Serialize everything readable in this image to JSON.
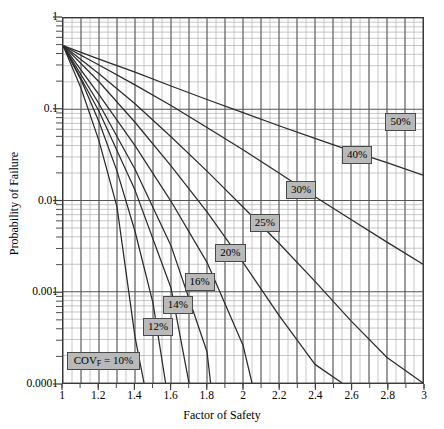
{
  "chart_data": {
    "type": "line",
    "title": "",
    "xlabel": "Factor of Safety",
    "ylabel": "Probability of Failure",
    "xscale": "linear",
    "yscale": "log",
    "xlim": [
      1,
      3
    ],
    "ylim": [
      0.0001,
      1
    ],
    "grid": true,
    "grid_style": "log-minor y, 0.05 minor x",
    "legend": "inline boxed labels on each curve",
    "xticks": [
      "1",
      "1.2",
      "1.4",
      "1.6",
      "1.8",
      "2",
      "2.2",
      "2.4",
      "2.6",
      "2.8",
      "3"
    ],
    "xtick_values": [
      1,
      1.2,
      1.4,
      1.6,
      1.8,
      2,
      2.2,
      2.4,
      2.6,
      2.8,
      3
    ],
    "yticks": [
      "1",
      "0.1",
      "0.01",
      "0.001",
      "0.0001"
    ],
    "ytick_values": [
      1,
      0.1,
      0.01,
      0.001,
      0.0001
    ],
    "series": [
      {
        "name": "COV_F = 10%",
        "label": "COV<sub>F</sub> = 10%",
        "label_text": "COVF = 10%",
        "cov_percent": 10,
        "x": [
          1.0,
          1.1,
          1.2,
          1.3,
          1.4,
          1.45
        ],
        "y": [
          0.5,
          0.17,
          0.045,
          0.0085,
          0.00032,
          0.0001
        ]
      },
      {
        "name": "12%",
        "label": "12%",
        "cov_percent": 12,
        "x": [
          1.0,
          1.1,
          1.2,
          1.3,
          1.4,
          1.5,
          1.57
        ],
        "y": [
          0.5,
          0.21,
          0.073,
          0.021,
          0.0046,
          0.00075,
          0.0001
        ]
      },
      {
        "name": "14%",
        "label": "14%",
        "cov_percent": 14,
        "x": [
          1.0,
          1.2,
          1.4,
          1.6,
          1.7
        ],
        "y": [
          0.5,
          0.095,
          0.013,
          0.0011,
          0.0001
        ]
      },
      {
        "name": "16%",
        "label": "16%",
        "cov_percent": 16,
        "x": [
          1.0,
          1.2,
          1.4,
          1.6,
          1.8,
          1.82
        ],
        "y": [
          0.5,
          0.115,
          0.022,
          0.0032,
          0.00022,
          0.0001
        ]
      },
      {
        "name": "20%",
        "label": "20%",
        "cov_percent": 20,
        "x": [
          1.0,
          1.2,
          1.4,
          1.6,
          1.8,
          2.0,
          2.05
        ],
        "y": [
          0.5,
          0.145,
          0.04,
          0.0098,
          0.0021,
          0.00026,
          0.0001
        ]
      },
      {
        "name": "25%",
        "label": "25%",
        "cov_percent": 25,
        "x": [
          1.0,
          1.2,
          1.4,
          1.6,
          1.8,
          2.0,
          2.2,
          2.4,
          2.55
        ],
        "y": [
          0.5,
          0.2,
          0.072,
          0.024,
          0.0075,
          0.0021,
          0.00055,
          0.00016,
          0.0001
        ]
      },
      {
        "name": "30%",
        "label": "30%",
        "cov_percent": 30,
        "x": [
          1.0,
          1.2,
          1.4,
          1.6,
          1.8,
          2.0,
          2.2,
          2.4,
          2.6,
          2.8,
          3.0
        ],
        "y": [
          0.5,
          0.245,
          0.115,
          0.05,
          0.021,
          0.0085,
          0.0034,
          0.0013,
          0.00048,
          0.00019,
          0.0001
        ]
      },
      {
        "name": "40%",
        "label": "40%",
        "cov_percent": 40,
        "x": [
          1.0,
          1.2,
          1.4,
          1.6,
          1.8,
          2.0,
          2.2,
          2.4,
          2.6,
          2.8,
          3.0
        ],
        "y": [
          0.5,
          0.305,
          0.185,
          0.11,
          0.063,
          0.036,
          0.02,
          0.011,
          0.0062,
          0.0035,
          0.002
        ]
      },
      {
        "name": "50%",
        "label": "50%",
        "cov_percent": 50,
        "x": [
          1.0,
          1.2,
          1.4,
          1.6,
          1.8,
          2.0,
          2.2,
          2.4,
          2.6,
          2.8,
          3.0
        ],
        "y": [
          0.5,
          0.355,
          0.255,
          0.18,
          0.128,
          0.092,
          0.066,
          0.048,
          0.035,
          0.026,
          0.019
        ]
      }
    ],
    "annotations": [
      {
        "text": "COVF = 10%",
        "x": 1.23,
        "y": 0.00018
      },
      {
        "text": "12%",
        "x": 1.53,
        "y": 0.00042
      },
      {
        "text": "14%",
        "x": 1.64,
        "y": 0.00072
      },
      {
        "text": "16%",
        "x": 1.76,
        "y": 0.0013
      },
      {
        "text": "20%",
        "x": 1.93,
        "y": 0.0027
      },
      {
        "text": "25%",
        "x": 2.12,
        "y": 0.0057
      },
      {
        "text": "30%",
        "x": 2.32,
        "y": 0.013
      },
      {
        "text": "40%",
        "x": 2.63,
        "y": 0.031
      },
      {
        "text": "50%",
        "x": 2.87,
        "y": 0.072
      }
    ]
  },
  "colors": {
    "curve": "#2b2b2b",
    "grid_major": "#555555",
    "grid_minor": "#b0b0b0",
    "frame": "#3a3a3a",
    "callout_fill": "#b9b9b9",
    "callout_border": "#4a4a4a",
    "background": "#ffffff"
  }
}
